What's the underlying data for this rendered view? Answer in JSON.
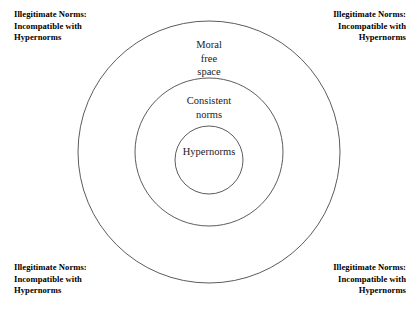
{
  "diagram": {
    "type": "concentric-circles",
    "title_sliver": "",
    "rings": [
      {
        "id": "outer",
        "label_lines": [
          "Moral",
          "free",
          "space"
        ],
        "label_text": "Moral free space",
        "radius": 131,
        "center_x": 209,
        "center_y": 152
      },
      {
        "id": "middle",
        "label_lines": [
          "Consistent",
          "norms"
        ],
        "label_text": "Consistent norms",
        "radius": 74,
        "center_x": 209,
        "center_y": 152
      },
      {
        "id": "inner",
        "label_lines": [
          "Hypernorms"
        ],
        "label_text": "Hypernorms",
        "radius": 34,
        "center_x": 209,
        "center_y": 160
      }
    ],
    "corner_annotations": [
      {
        "id": "top-left",
        "align": "left",
        "lines": [
          "Illegitimate Norms:",
          "Incompatible with",
          "Hypernorms"
        ]
      },
      {
        "id": "top-right",
        "align": "right",
        "lines": [
          "Illegitimate Norms:",
          "Incompatible with",
          "Hypernorms"
        ]
      },
      {
        "id": "bottom-left",
        "align": "left",
        "lines": [
          "Illegitimate Norms:",
          "Incompatible with",
          "Hypernorms"
        ]
      },
      {
        "id": "bottom-right",
        "align": "right",
        "lines": [
          "Illegitimate Norms:",
          "Incompatible with",
          "Hypernorms"
        ]
      }
    ],
    "colors": {
      "background": "#ffffff",
      "stroke": "#4a4a4a",
      "ring_label_text": "#1a1a1a",
      "corner_label_text": "#000000"
    }
  }
}
